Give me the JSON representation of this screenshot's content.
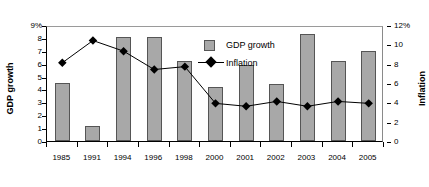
{
  "chart_data": {
    "type": "bar",
    "title": "",
    "subtitle": "",
    "xlabel": "",
    "categories": [
      "1985",
      "1991",
      "1994",
      "1996",
      "1998",
      "2000",
      "2001",
      "2002",
      "2003",
      "2004",
      "2005"
    ],
    "grid": false,
    "legend_position": "inside-top-center",
    "axes": {
      "left": {
        "label": "GDP growth",
        "ticks": [
          "9%",
          "8",
          "7",
          "6",
          "5",
          "4",
          "3",
          "2",
          "1",
          "0"
        ],
        "tick_values": [
          9,
          8,
          7,
          6,
          5,
          4,
          3,
          2,
          1,
          0
        ],
        "min": 0,
        "max": 9,
        "unit": "%"
      },
      "right": {
        "label": "Inflation",
        "ticks": [
          "12%",
          "10",
          "8",
          "6",
          "4",
          "2",
          "0"
        ],
        "tick_values": [
          12,
          10,
          8,
          6,
          4,
          2,
          0
        ],
        "min": 0,
        "max": 12,
        "unit": "%"
      }
    },
    "series": [
      {
        "name": "GDP growth",
        "type": "bar",
        "axis": "left",
        "color": "#a8a8a8",
        "values": [
          4.5,
          1.2,
          8.1,
          8.1,
          6.2,
          4.2,
          5.9,
          4.4,
          8.3,
          6.2,
          7.0
        ]
      },
      {
        "name": "Inflation",
        "type": "line",
        "axis": "right",
        "color": "#000000",
        "marker": "diamond",
        "values": [
          8.3,
          10.6,
          9.5,
          7.6,
          7.9,
          4.1,
          3.8,
          4.3,
          3.8,
          4.3,
          4.1
        ]
      }
    ]
  },
  "legend": {
    "items": [
      {
        "label": "GDP growth",
        "marker": "square-swatch"
      },
      {
        "label": "Inflation",
        "marker": "line-diamond"
      }
    ]
  }
}
